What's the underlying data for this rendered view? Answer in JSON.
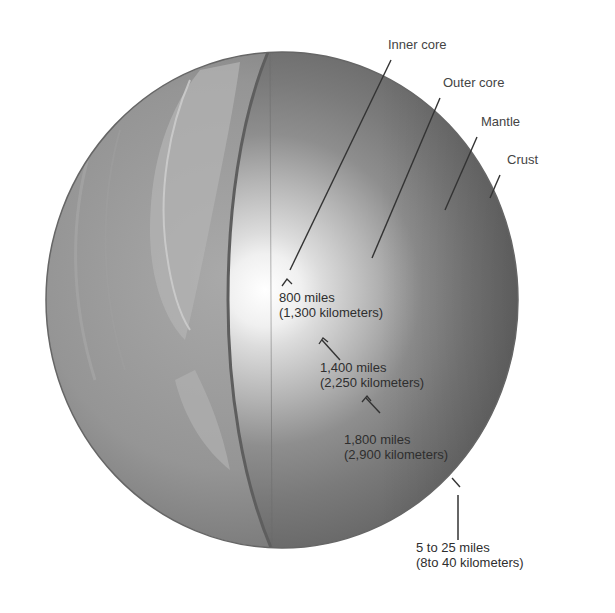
{
  "diagram": {
    "type": "cutaway-sphere",
    "layers": [
      {
        "id": "inner-core",
        "label": "Inner core"
      },
      {
        "id": "outer-core",
        "label": "Outer core"
      },
      {
        "id": "mantle",
        "label": "Mantle"
      },
      {
        "id": "crust",
        "label": "Crust"
      }
    ],
    "distances": [
      {
        "id": "inner-core-radius",
        "line1": "800 miles",
        "line2": "(1,300 kilometers)"
      },
      {
        "id": "outer-core-thickness",
        "line1": "1,400 miles",
        "line2": "(2,250 kilometers)"
      },
      {
        "id": "mantle-thickness",
        "line1": "1,800 miles",
        "line2": "(2,900 kilometers)"
      },
      {
        "id": "crust-thickness",
        "line1": "5 to 25 miles",
        "line2": "(8to 40 kilometers)"
      }
    ],
    "colors": {
      "background": "#ffffff",
      "surface": "#8f8f8f",
      "mantle": "#7a7a7a",
      "outer_core": "#a8a8a8",
      "inner_core": "#f2f2f2",
      "leader_lines": "#333333",
      "text": "#3a3a3a"
    }
  }
}
